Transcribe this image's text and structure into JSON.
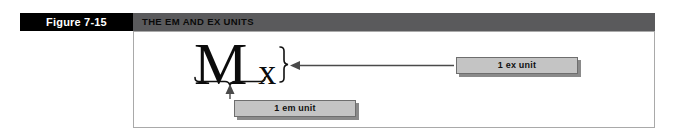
{
  "figure": {
    "number_label": "Figure 7-15",
    "title": "THE EM AND EX UNITS"
  },
  "specimen": {
    "em_glyph": "M",
    "ex_glyph": "x"
  },
  "callouts": [
    {
      "name": "ex-unit",
      "label": "1 ex unit"
    },
    {
      "name": "em-unit",
      "label": "1 em unit"
    }
  ],
  "colors": {
    "number_band": "#000000",
    "title_band": "#5a5a5c",
    "panel_background": "#ffffff",
    "panel_border": "#a9a9a9",
    "callout_fill": "#c4c4c4",
    "callout_border": "#6e6e6e",
    "callout_shadow": "#8a8a8a",
    "ink": "#0b0b0b"
  }
}
